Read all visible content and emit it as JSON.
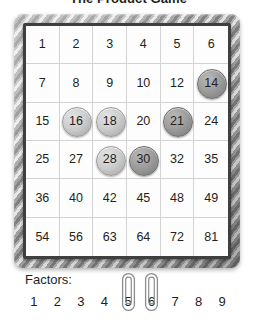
{
  "title": "The Product Game",
  "board": {
    "name": "product-grid",
    "rows": [
      [
        "1",
        "2",
        "3",
        "4",
        "5",
        "6"
      ],
      [
        "7",
        "8",
        "9",
        "10",
        "12",
        "14"
      ],
      [
        "15",
        "16",
        "18",
        "20",
        "21",
        "24"
      ],
      [
        "25",
        "27",
        "28",
        "30",
        "32",
        "35"
      ],
      [
        "36",
        "40",
        "42",
        "45",
        "48",
        "49"
      ],
      [
        "54",
        "56",
        "63",
        "64",
        "72",
        "81"
      ]
    ],
    "markers": [
      {
        "value": "14",
        "row": 1,
        "col": 5,
        "shade": "dark"
      },
      {
        "value": "16",
        "row": 2,
        "col": 1,
        "shade": "light"
      },
      {
        "value": "18",
        "row": 2,
        "col": 2,
        "shade": "light"
      },
      {
        "value": "21",
        "row": 2,
        "col": 4,
        "shade": "dark"
      },
      {
        "value": "28",
        "row": 3,
        "col": 2,
        "shade": "light"
      },
      {
        "value": "30",
        "row": 3,
        "col": 3,
        "shade": "dark"
      }
    ],
    "marker_colors": {
      "light_fill": "#cecece",
      "light_border": "#9a9a9a",
      "dark_fill": "#9e9e9e",
      "dark_border": "#6f6f6f"
    },
    "frame_color": "#a9a9a9",
    "grid_border_color": "#3f3f3f"
  },
  "factors": {
    "label": "Factors:",
    "values": [
      "1",
      "2",
      "3",
      "4",
      "5",
      "6",
      "7",
      "8",
      "9"
    ],
    "paperclips": [
      {
        "name": "paperclip-on-5",
        "on_value": "5"
      },
      {
        "name": "paperclip-on-6",
        "on_value": "6"
      }
    ],
    "paperclip_color": "#8d8d8d"
  }
}
